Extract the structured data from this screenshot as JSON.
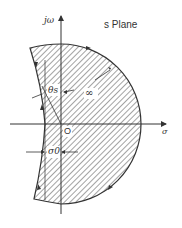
{
  "diagram": {
    "title": "s Plane",
    "axes": {
      "imaginary_label": "jω",
      "real_label": "σ",
      "origin_label": "O"
    },
    "annotations": {
      "angle_label": "θs",
      "infinity_label": "∞",
      "offset_label": "σ0"
    },
    "region": {
      "fill": "hatched",
      "description": "Contour enclosing shaded region bounded by large semicircle of infinite radius on right and curved boundary left of jω axis"
    },
    "colors": {
      "stroke": "#333333",
      "hatch": "#555555",
      "background": "#ffffff"
    }
  }
}
